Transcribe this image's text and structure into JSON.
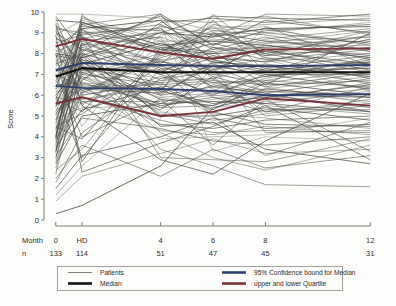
{
  "chart_data": {
    "type": "line",
    "title": "",
    "subtitle": "",
    "xlabel": "Month",
    "ylabel": "Score",
    "ylim": [
      0,
      10
    ],
    "yticks": [
      0,
      1,
      2,
      3,
      4,
      5,
      6,
      7,
      8,
      9,
      10
    ],
    "ytick_labels": [
      "0",
      "1",
      "2",
      "3",
      "4",
      "5",
      "6",
      "7",
      "8",
      "9",
      "10"
    ],
    "grid": false,
    "legend_position": "bottom",
    "x_categories": [
      "0",
      "HD",
      "4",
      "6",
      "8",
      "12"
    ],
    "x_positions": [
      0,
      1,
      4,
      6,
      8,
      12
    ],
    "xlim": [
      -0.45,
      12.6
    ],
    "n_row_label": "n",
    "n_values": [
      133,
      114,
      51,
      47,
      45,
      31
    ],
    "series": [
      {
        "name": "Median",
        "color": "#111111",
        "width": 2.1,
        "values": [
          6.9,
          7.3,
          7.1,
          7.1,
          7.1,
          7.1
        ]
      },
      {
        "name": "95% Confidence bound for Median (upper)",
        "color": "#2d3f6e",
        "width": 1.9,
        "values": [
          7.2,
          7.55,
          7.45,
          7.4,
          7.4,
          7.45
        ]
      },
      {
        "name": "95% Confidence bound for Median (lower)",
        "color": "#2d3f6e",
        "width": 1.9,
        "values": [
          6.45,
          6.35,
          6.3,
          6.2,
          6.0,
          6.05
        ]
      },
      {
        "name": "upper Quartile",
        "color": "#7b3138",
        "width": 1.9,
        "values": [
          8.35,
          8.7,
          8.05,
          7.75,
          8.2,
          8.25
        ]
      },
      {
        "name": "lower Quartile",
        "color": "#7b3138",
        "width": 1.9,
        "values": [
          5.6,
          5.9,
          5.0,
          5.2,
          5.85,
          5.5
        ]
      }
    ],
    "patients_note": "individual patient trajectories (thin grey lines)",
    "patient_line_color": "#4a4a46",
    "patients": [
      [
        9.9,
        9.9,
        9.7,
        9.1,
        9.3,
        8.1
      ],
      [
        9.8,
        8.1,
        9.9,
        8.4,
        9.6,
        9.0
      ],
      [
        9.6,
        9.5,
        8.2,
        8.0,
        8.1,
        7.5
      ],
      [
        9.5,
        7.0,
        8.0,
        9.6,
        7.1,
        8.6
      ],
      [
        9.3,
        8.8,
        7.6,
        7.2,
        8.4,
        7.9
      ],
      [
        9.2,
        9.0,
        9.2,
        7.0,
        6.6,
        7.2
      ],
      [
        9.1,
        6.5,
        6.2,
        9.0,
        7.8,
        6.8
      ],
      [
        9.0,
        8.2,
        7.0,
        6.0,
        7.0,
        7.0
      ],
      [
        8.9,
        9.6,
        8.6,
        8.6,
        9.0,
        9.5
      ],
      [
        8.8,
        7.6,
        5.8,
        5.5,
        6.3,
        5.9
      ],
      [
        8.7,
        8.4,
        8.8,
        7.9,
        7.6,
        8.0
      ],
      [
        8.6,
        6.0,
        6.6,
        6.8,
        5.2,
        6.4
      ],
      [
        8.5,
        8.9,
        9.4,
        8.2,
        8.8,
        7.7
      ],
      [
        8.4,
        7.2,
        7.4,
        7.5,
        6.9,
        7.4
      ],
      [
        8.3,
        9.2,
        6.0,
        6.4,
        6.1,
        5.2
      ],
      [
        8.2,
        5.5,
        8.4,
        7.7,
        8.6,
        8.8
      ],
      [
        8.1,
        8.6,
        7.2,
        5.9,
        5.6,
        6.2
      ],
      [
        8.0,
        7.8,
        9.0,
        8.8,
        9.2,
        9.3
      ],
      [
        7.9,
        6.8,
        5.4,
        6.2,
        7.3,
        6.6
      ],
      [
        7.8,
        9.4,
        8.1,
        9.3,
        8.0,
        7.1
      ],
      [
        7.7,
        7.4,
        6.8,
        7.1,
        6.4,
        5.6
      ],
      [
        7.6,
        6.2,
        7.8,
        8.5,
        7.9,
        8.3
      ],
      [
        7.5,
        8.0,
        5.0,
        5.0,
        5.4,
        4.8
      ],
      [
        7.4,
        8.7,
        9.6,
        9.5,
        9.8,
        8.9
      ],
      [
        7.3,
        5.8,
        6.4,
        6.6,
        6.7,
        7.6
      ],
      [
        7.2,
        7.1,
        7.6,
        7.3,
        7.5,
        7.0
      ],
      [
        7.1,
        9.1,
        8.3,
        6.9,
        6.2,
        6.0
      ],
      [
        7.0,
        6.4,
        4.6,
        4.4,
        4.8,
        5.0
      ],
      [
        6.9,
        8.3,
        7.1,
        8.1,
        8.3,
        8.4
      ],
      [
        6.8,
        7.7,
        6.2,
        5.6,
        5.9,
        6.5
      ],
      [
        6.7,
        5.2,
        8.9,
        9.2,
        9.4,
        9.7
      ],
      [
        6.6,
        8.5,
        7.3,
        7.0,
        7.2,
        7.3
      ],
      [
        6.5,
        6.6,
        5.6,
        6.5,
        6.0,
        5.4
      ],
      [
        6.4,
        9.3,
        9.1,
        8.3,
        7.7,
        8.2
      ],
      [
        6.3,
        7.3,
        6.6,
        5.2,
        4.6,
        4.5
      ],
      [
        6.2,
        6.1,
        7.9,
        8.7,
        8.5,
        9.1
      ],
      [
        6.1,
        8.1,
        5.2,
        4.8,
        5.1,
        5.8
      ],
      [
        6.0,
        7.5,
        8.5,
        7.6,
        7.4,
        6.9
      ],
      [
        5.9,
        5.6,
        6.9,
        6.1,
        6.8,
        7.8
      ],
      [
        5.8,
        8.8,
        7.5,
        9.4,
        9.0,
        8.5
      ],
      [
        5.7,
        6.9,
        5.9,
        5.4,
        5.7,
        6.1
      ],
      [
        5.6,
        7.9,
        9.3,
        8.9,
        8.2,
        7.2
      ],
      [
        5.5,
        6.3,
        6.1,
        7.4,
        7.0,
        6.3
      ],
      [
        5.4,
        9.7,
        8.7,
        6.3,
        5.5,
        5.1
      ],
      [
        5.3,
        5.9,
        4.8,
        4.2,
        4.3,
        4.2
      ],
      [
        5.2,
        8.2,
        7.7,
        8.0,
        8.7,
        9.2
      ],
      [
        5.1,
        7.0,
        6.5,
        6.7,
        6.5,
        6.7
      ],
      [
        5.0,
        6.7,
        9.5,
        9.7,
        9.5,
        9.9
      ],
      [
        4.9,
        5.4,
        5.5,
        5.8,
        6.2,
        5.7
      ],
      [
        4.8,
        8.0,
        7.0,
        7.8,
        7.6,
        8.7
      ],
      [
        4.7,
        6.6,
        6.3,
        5.1,
        4.9,
        4.4
      ],
      [
        4.6,
        9.0,
        8.2,
        9.1,
        8.9,
        8.1
      ],
      [
        4.5,
        5.1,
        7.4,
        6.6,
        6.1,
        6.8
      ],
      [
        4.4,
        7.6,
        5.1,
        4.6,
        5.3,
        5.3
      ],
      [
        4.3,
        8.4,
        9.8,
        8.4,
        9.1,
        9.4
      ],
      [
        4.2,
        6.0,
        6.7,
        7.2,
        7.8,
        7.5
      ],
      [
        4.1,
        7.4,
        4.2,
        3.0,
        2.4,
        3.6
      ],
      [
        4.0,
        9.5,
        8.4,
        8.6,
        8.4,
        7.8
      ],
      [
        3.9,
        5.7,
        5.7,
        6.0,
        5.8,
        6.6
      ],
      [
        3.8,
        7.2,
        7.2,
        7.9,
        7.3,
        7.9
      ],
      [
        3.7,
        6.5,
        3.9,
        4.0,
        4.1,
        4.9
      ],
      [
        3.6,
        8.6,
        9.0,
        9.8,
        9.7,
        9.6
      ],
      [
        3.5,
        5.3,
        6.4,
        5.3,
        6.6,
        6.0
      ],
      [
        3.4,
        7.8,
        8.6,
        7.1,
        8.5,
        8.6
      ],
      [
        3.3,
        6.2,
        5.3,
        6.9,
        5.0,
        5.5
      ],
      [
        3.2,
        9.8,
        7.9,
        8.8,
        9.9,
        9.8
      ],
      [
        3.1,
        4.9,
        4.4,
        3.8,
        3.6,
        4.0
      ],
      [
        3.0,
        7.1,
        6.0,
        7.6,
        7.1,
        7.3
      ],
      [
        2.9,
        8.3,
        8.8,
        6.2,
        6.3,
        6.9
      ],
      [
        2.7,
        5.0,
        5.6,
        5.7,
        5.6,
        5.2
      ],
      [
        2.5,
        6.8,
        7.6,
        8.2,
        8.3,
        8.8
      ],
      [
        2.2,
        7.5,
        3.4,
        2.6,
        1.7,
        1.6
      ],
      [
        2.0,
        3.6,
        2.1,
        3.4,
        2.5,
        3.1
      ],
      [
        1.8,
        4.2,
        6.8,
        7.4,
        6.4,
        7.1
      ],
      [
        1.5,
        3.1,
        4.0,
        4.9,
        4.4,
        4.6
      ],
      [
        1.2,
        2.6,
        5.9,
        6.1,
        5.9,
        6.3
      ],
      [
        0.9,
        2.1,
        3.2,
        3.9,
        3.2,
        3.4
      ],
      [
        0.3,
        0.7,
        2.6,
        5.4,
        6.0,
        5.9
      ],
      [
        2.4,
        3.4,
        8.0,
        8.9,
        9.2,
        8.4
      ],
      [
        6.0,
        3.0,
        7.3,
        5.0,
        3.1,
        4.7
      ],
      [
        7.3,
        4.5,
        9.4,
        3.3,
        4.0,
        3.8
      ],
      [
        8.9,
        2.3,
        3.7,
        4.5,
        5.5,
        2.9
      ],
      [
        9.4,
        5.5,
        2.9,
        2.2,
        3.8,
        6.1
      ],
      [
        4.0,
        9.9,
        6.1,
        9.9,
        7.9,
        9.1
      ],
      [
        5.5,
        8.5,
        4.9,
        7.3,
        4.2,
        4.3
      ],
      [
        6.3,
        9.4,
        9.9,
        6.7,
        9.3,
        7.4
      ],
      [
        7.0,
        4.0,
        5.8,
        3.6,
        5.8,
        3.3
      ],
      [
        8.0,
        2.8,
        8.3,
        8.1,
        6.5,
        9.0
      ],
      [
        9.7,
        6.4,
        6.5,
        9.6,
        7.7,
        6.5
      ],
      [
        3.3,
        7.9,
        4.5,
        4.7,
        3.4,
        2.7
      ],
      [
        5.8,
        5.2,
        9.2,
        7.5,
        8.1,
        8.0
      ],
      [
        7.6,
        8.9,
        3.0,
        2.9,
        2.8,
        3.9
      ],
      [
        2.8,
        6.1,
        7.7,
        6.4,
        6.9,
        7.7
      ],
      [
        9.2,
        7.3,
        5.5,
        5.9,
        5.2,
        5.6
      ],
      [
        4.5,
        3.9,
        8.1,
        9.0,
        8.6,
        8.2
      ],
      [
        6.7,
        8.7,
        6.7,
        6.8,
        7.5,
        6.2
      ],
      [
        8.4,
        5.7,
        4.3,
        4.1,
        4.5,
        4.1
      ],
      [
        3.9,
        9.2,
        9.6,
        7.7,
        7.2,
        7.6
      ],
      [
        5.1,
        6.9,
        5.4,
        5.5,
        6.7,
        6.4
      ],
      [
        7.9,
        7.7,
        7.1,
        8.3,
        8.0,
        8.9
      ]
    ],
    "legend_entries": [
      {
        "label": "Patients",
        "color": "#7d7d78",
        "width": 1.0
      },
      {
        "label": "Median",
        "color": "#111111",
        "width": 2.6
      },
      {
        "label": "95% Confidence bound for Median",
        "color": "#2d3f6e",
        "width": 2.6
      },
      {
        "label": "upper and lower Quartile",
        "color": "#7b3138",
        "width": 2.6
      }
    ]
  },
  "axes": {
    "y_title": "Score",
    "month_row_label": "Month",
    "n_row_label": "n"
  }
}
